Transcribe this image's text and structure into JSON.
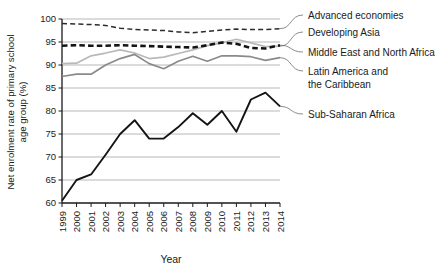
{
  "chart_data": {
    "type": "line",
    "title": "",
    "xlabel": "Year",
    "ylabel": "Net enrolment rate of primary school age group (%)",
    "ylim": [
      60,
      100
    ],
    "ytick_labels": [
      "60",
      "65",
      "70",
      "75",
      "80",
      "85",
      "90",
      "95",
      "100"
    ],
    "yticks": [
      60,
      65,
      70,
      75,
      80,
      85,
      90,
      95,
      100
    ],
    "grid": "horizontal",
    "legend_position": "right-outside",
    "categories": [
      "1999",
      "2000",
      "2001",
      "2002",
      "2003",
      "2004",
      "2005",
      "2006",
      "2007",
      "2008",
      "2009",
      "2010",
      "2011",
      "2012",
      "2013",
      "2014"
    ],
    "x": [
      1999,
      2000,
      2001,
      2002,
      2003,
      2004,
      2005,
      2006,
      2007,
      2008,
      2009,
      2010,
      2011,
      2012,
      2013,
      2014
    ],
    "series": [
      {
        "name": "Advanced economies",
        "style": "thin-dashed",
        "color": "#2b2b2b",
        "values": [
          99.0,
          98.9,
          98.8,
          98.6,
          98.0,
          97.7,
          97.6,
          97.5,
          97.2,
          97.0,
          97.3,
          97.6,
          97.8,
          97.7,
          97.7,
          97.9
        ]
      },
      {
        "name": "Developing Asia",
        "style": "solid-light-gray",
        "color": "#b9b9b9",
        "values": [
          90.3,
          90.4,
          92.0,
          92.6,
          93.3,
          92.6,
          91.4,
          91.7,
          92.5,
          93.3,
          94.2,
          94.8,
          95.6,
          94.8,
          94.0,
          94.1
        ]
      },
      {
        "name": "Middle East and North Africa",
        "style": "thick-dashed",
        "color": "#141414",
        "values": [
          94.2,
          94.3,
          94.2,
          94.2,
          94.3,
          94.2,
          94.1,
          94.0,
          93.9,
          93.8,
          94.3,
          94.9,
          94.6,
          93.7,
          93.6,
          94.3
        ]
      },
      {
        "name": "Latin America and the Caribbean",
        "style": "solid-gray",
        "color": "#8a8a8a",
        "values": [
          87.5,
          88.0,
          88.0,
          90.0,
          91.4,
          92.3,
          90.3,
          89.2,
          90.8,
          91.9,
          90.8,
          92.0,
          92.0,
          91.8,
          91.0,
          91.6
        ]
      },
      {
        "name": "Sub-Saharan Africa",
        "style": "solid-black",
        "color": "#141414",
        "values": [
          60.5,
          65.0,
          66.2,
          70.5,
          75.0,
          78.0,
          74.0,
          74.0,
          76.5,
          79.5,
          77.0,
          80.0,
          75.5,
          82.5,
          84.0,
          81.0
        ]
      }
    ]
  },
  "axis": {
    "x_title": "Year",
    "y_title_line1": "Net enrolment rate of primary school",
    "y_title_line2": "age group (%)"
  },
  "legend": {
    "items": [
      {
        "label": "Advanced economies"
      },
      {
        "label": "Developing Asia"
      },
      {
        "label": "Middle East and North Africa"
      },
      {
        "label": "Latin America and"
      },
      {
        "label": "the Caribbean"
      },
      {
        "label": "Sub-Saharan Africa"
      }
    ]
  }
}
